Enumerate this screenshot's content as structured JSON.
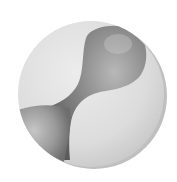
{
  "image": {
    "subject": "grayscale sphere disc with hourglass blob shape",
    "background": "#ffffff",
    "colors": {
      "disc_light": "#e6e6e6",
      "disc_mid": "#d2d2d2",
      "blob_dark": "#5e5e5e",
      "blob_mid": "#8a8a8a",
      "blob_light": "#c4c4c4",
      "rim_shadow": "#7a7a7a"
    }
  }
}
